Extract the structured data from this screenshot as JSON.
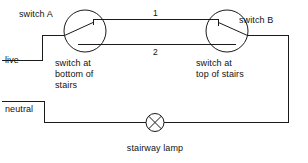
{
  "diagram": {
    "cropped_top_text": "",
    "colors": {
      "wire": "#1a1a1a",
      "background": "#ffffff",
      "text": "#111111"
    },
    "labels": {
      "switch_a": "switch A",
      "switch_b": "switch B",
      "live": "live",
      "neutral": "neutral",
      "lamp": "stairway lamp",
      "caption_a_line1": "switch at",
      "caption_a_line2": "bottom of",
      "caption_a_line3": "stairs",
      "caption_b_line1": "switch at",
      "caption_b_line2": "top of stairs",
      "wire_1": "1",
      "wire_2": "2"
    },
    "symbols": {
      "switch_a": "two-way-switch-icon",
      "switch_b": "two-way-switch-icon",
      "lamp": "lamp-crossed-circle-icon"
    }
  }
}
